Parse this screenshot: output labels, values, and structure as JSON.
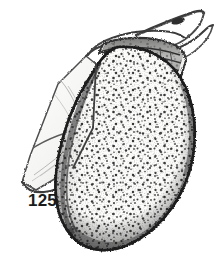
{
  "figure": {
    "label": "125",
    "caption_number": "125",
    "kind": "scientific-line-drawing",
    "background_color": "#ffffff",
    "ink_color": "#2b2b2b",
    "stipple_color": "#3a3a3a",
    "margin_shade_color": "#4a4a4a",
    "flap_fill_color": "#fbfbfa",
    "flap_line_color": "#555555"
  },
  "parts": {
    "body": {
      "name": "carapace-body",
      "description": "large ovate stippled valve"
    },
    "flap": {
      "name": "left-flap",
      "description": "pale angular two-panel flap on lower left"
    },
    "head": {
      "name": "head-shield",
      "description": "banded segment across the top"
    },
    "antenna_upper": {
      "name": "antenna-upper",
      "description": "long thin projection to upper right"
    },
    "antenna_lower": {
      "name": "antenna-lower",
      "description": "second thin projection to right"
    }
  }
}
